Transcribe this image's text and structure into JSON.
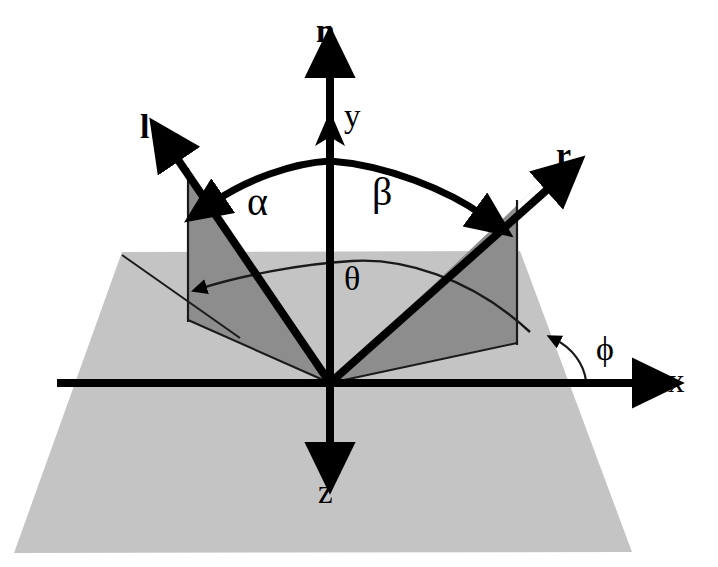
{
  "figure": {
    "type": "vector-geometry-diagram",
    "width": 718,
    "height": 567,
    "background_color": "#ffffff"
  },
  "colors": {
    "background": "#ffffff",
    "plane_fill": "#c4c4c4",
    "triangle_fill": "#8d8d8d",
    "stroke": "#000000",
    "thin_stroke": "#1a1a1a"
  },
  "labels": {
    "normal": "n",
    "y_axis": "y",
    "z_axis": "z",
    "x_axis": "x",
    "light_vector": "l",
    "reflection_vector": "r",
    "alpha": "α",
    "beta": "β",
    "theta": "θ",
    "phi": "ϕ"
  },
  "label_positions": {
    "normal": {
      "x": 316,
      "y": 14
    },
    "y_axis": {
      "x": 344,
      "y": 100
    },
    "z_axis": {
      "x": 318,
      "y": 495
    },
    "x_axis": {
      "x": 668,
      "y": 363
    },
    "light_vector": {
      "x": 140,
      "y": 110
    },
    "reflection_vector": {
      "x": 556,
      "y": 135
    },
    "alpha": {
      "x": 247,
      "y": 182
    },
    "beta": {
      "x": 372,
      "y": 178
    },
    "theta": {
      "x": 344,
      "y": 268
    },
    "phi": {
      "x": 596,
      "y": 340
    }
  },
  "geometry": {
    "origin": {
      "x": 330,
      "y": 383
    },
    "plane_corners": [
      {
        "x": 122,
        "y": 252
      },
      {
        "x": 520,
        "y": 251
      },
      {
        "x": 632,
        "y": 552
      },
      {
        "x": 14,
        "y": 553
      }
    ],
    "n_axis": {
      "x1": 330,
      "y1": 383,
      "x2": 330,
      "y2": 55,
      "arrow": "up",
      "label": "n"
    },
    "y_axis_arrow": {
      "x": 330,
      "y": 113,
      "direction": "up",
      "label": "y"
    },
    "z_axis": {
      "x1": 330,
      "y1": 383,
      "x2": 330,
      "y2": 466,
      "arrow": "down",
      "label": "z"
    },
    "x_axis": {
      "x1": 57,
      "y1": 383,
      "x2": 655,
      "y2": 383,
      "arrow": "right",
      "label": "x"
    },
    "l_vector": {
      "x1": 330,
      "y1": 383,
      "x2": 162,
      "y2": 139,
      "label": "l"
    },
    "r_vector": {
      "x1": 330,
      "y1": 383,
      "x2": 566,
      "y2": 172,
      "label": "r"
    },
    "l_drop_line": {
      "x": 188,
      "y_top": 172,
      "y_bottom": 320
    },
    "r_drop_line": {
      "x": 517,
      "y_top": 205,
      "y_bottom": 343
    },
    "l_projection": {
      "x1": 330,
      "y1": 383,
      "x2": 188,
      "y2": 320
    },
    "r_projection": {
      "x1": 330,
      "y1": 383,
      "x2": 517,
      "y2": 343
    },
    "alpha_beta_arc": {
      "description": "double-headed curved arrow spanning from l to r across the normal",
      "left_tip": {
        "x": 205,
        "y": 208
      },
      "apex": {
        "x": 332,
        "y": 160
      },
      "right_tip": {
        "x": 490,
        "y": 220
      }
    },
    "theta_arc": {
      "description": "arc on the plane from the r projection to the l projection",
      "left_tip": {
        "x": 196,
        "y": 286
      },
      "apex": {
        "x": 352,
        "y": 262
      },
      "right_end": {
        "x": 530,
        "y": 330
      }
    },
    "phi_arc": {
      "description": "small arc between the x-axis and the r projection on the plane",
      "start": {
        "x": 580,
        "y": 381
      },
      "tip": {
        "x": 552,
        "y": 338
      }
    }
  },
  "angles": {
    "alpha": {
      "symbol": "α",
      "between": [
        "n",
        "l"
      ],
      "description": "angle between surface normal and light vector"
    },
    "beta": {
      "symbol": "β",
      "between": [
        "n",
        "r"
      ],
      "description": "angle between surface normal and reflection vector"
    },
    "theta": {
      "symbol": "θ",
      "between": [
        "l-projection",
        "r-projection"
      ],
      "description": "azimuthal separation in the plane"
    },
    "phi": {
      "symbol": "ϕ",
      "between": [
        "x-axis",
        "r-projection"
      ],
      "description": "azimuth of the reflection vector from the x axis"
    }
  }
}
